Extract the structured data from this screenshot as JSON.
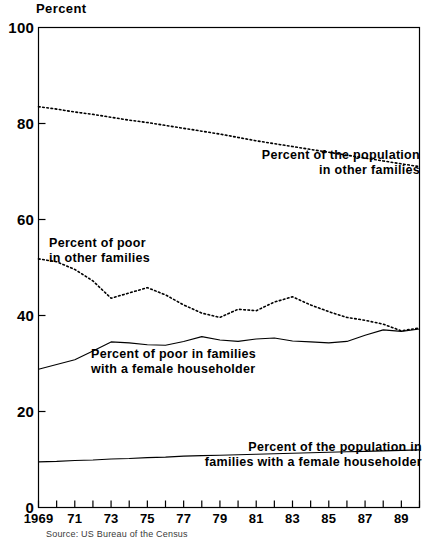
{
  "chart_data": {
    "type": "line",
    "title": "",
    "ylabel": "Percent",
    "xlabel": "",
    "ylim": [
      0,
      100
    ],
    "xlim": [
      1969,
      1990
    ],
    "grid": false,
    "legend_position": "inline-annotations",
    "y_ticks": [
      0,
      20,
      40,
      60,
      80,
      100
    ],
    "y_tick_labels": [
      "0",
      "20",
      "40",
      "60",
      "80",
      "100"
    ],
    "x": [
      1969,
      1970,
      1971,
      1972,
      1973,
      1974,
      1975,
      1976,
      1977,
      1978,
      1979,
      1980,
      1981,
      1982,
      1983,
      1984,
      1985,
      1986,
      1987,
      1988,
      1989,
      1990
    ],
    "x_ticks": [
      1969,
      1970,
      1971,
      1972,
      1973,
      1974,
      1975,
      1976,
      1977,
      1978,
      1979,
      1980,
      1981,
      1982,
      1983,
      1984,
      1985,
      1986,
      1987,
      1988,
      1989,
      1990
    ],
    "x_tick_labels": [
      "1969",
      "",
      "71",
      "",
      "73",
      "",
      "75",
      "",
      "77",
      "",
      "79",
      "",
      "81",
      "",
      "83",
      "",
      "85",
      "",
      "87",
      "",
      "89",
      ""
    ],
    "series": [
      {
        "name": "Percent of the population in other families",
        "style": "dotted",
        "values": [
          83.5,
          83.0,
          82.4,
          81.9,
          81.3,
          80.7,
          80.2,
          79.6,
          79.0,
          78.4,
          77.8,
          77.1,
          76.4,
          75.8,
          75.2,
          74.6,
          74.0,
          73.4,
          72.8,
          72.2,
          71.6,
          71.0
        ]
      },
      {
        "name": "Percent of poor in other families",
        "style": "dotted",
        "values": [
          51.8,
          51.2,
          49.6,
          47.2,
          43.6,
          44.7,
          45.8,
          44.3,
          42.2,
          40.5,
          39.6,
          41.3,
          41.0,
          42.8,
          43.9,
          42.2,
          40.8,
          39.6,
          39.0,
          38.2,
          36.8,
          37.4
        ]
      },
      {
        "name": "Percent of poor in families with a female householder",
        "style": "solid",
        "values": [
          28.8,
          29.8,
          30.8,
          32.6,
          34.5,
          34.3,
          33.9,
          33.8,
          34.6,
          35.6,
          34.9,
          34.6,
          35.1,
          35.3,
          34.7,
          34.5,
          34.3,
          34.6,
          35.9,
          37.0,
          36.7,
          37.2
        ]
      },
      {
        "name": "Percent of the population in families with a female householder",
        "style": "solid",
        "values": [
          9.5,
          9.6,
          9.8,
          9.9,
          10.1,
          10.2,
          10.4,
          10.5,
          10.7,
          10.8,
          10.9,
          11.0,
          11.1,
          11.2,
          11.3,
          11.4,
          11.5,
          11.6,
          11.7,
          11.8,
          11.9,
          12.0
        ]
      }
    ],
    "annotations": [
      {
        "id": "annot-population-other-families",
        "lines": [
          "Percent of the population",
          "in other families"
        ],
        "align": "right",
        "x_px": 420,
        "y_px": 148
      },
      {
        "id": "annot-poor-other-families",
        "lines": [
          "Percent of poor",
          "in other families"
        ],
        "align": "left",
        "x_px": 49,
        "y_px": 236
      },
      {
        "id": "annot-poor-female-householder",
        "lines": [
          "Percent of poor in families",
          "with a female householder"
        ],
        "align": "left",
        "x_px": 91,
        "y_px": 347
      },
      {
        "id": "annot-population-female-householder",
        "lines": [
          "Percent of the population in",
          "families with a female householder"
        ],
        "align": "right",
        "x_px": 422,
        "y_px": 440
      }
    ],
    "source": "Source: US Bureau of the Census",
    "colors": {
      "axis": "#000000",
      "line": "#000000",
      "background": "#ffffff"
    }
  }
}
